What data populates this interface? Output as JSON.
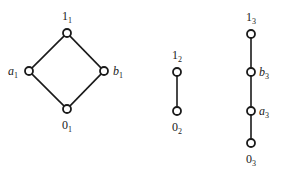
{
  "diagram": {
    "lattices": [
      {
        "id": "L1",
        "shape": "diamond",
        "nodes": [
          {
            "id": "1_1",
            "base": "1",
            "sub": "1",
            "italic": false,
            "x": 67,
            "y": 33,
            "lx": 67,
            "ly": 20,
            "anchor": "middle"
          },
          {
            "id": "a_1",
            "base": "a",
            "sub": "1",
            "italic": true,
            "x": 29,
            "y": 71,
            "lx": 18,
            "ly": 75,
            "anchor": "end"
          },
          {
            "id": "b_1",
            "base": "b",
            "sub": "1",
            "italic": true,
            "x": 104,
            "y": 71,
            "lx": 113,
            "ly": 75,
            "anchor": "start"
          },
          {
            "id": "0_1",
            "base": "0",
            "sub": "1",
            "italic": false,
            "x": 67,
            "y": 109,
            "lx": 67,
            "ly": 129,
            "anchor": "middle"
          }
        ],
        "edges": [
          [
            "0_1",
            "a_1"
          ],
          [
            "0_1",
            "b_1"
          ],
          [
            "a_1",
            "1_1"
          ],
          [
            "b_1",
            "1_1"
          ]
        ]
      },
      {
        "id": "L2",
        "shape": "chain",
        "nodes": [
          {
            "id": "1_2",
            "base": "1",
            "sub": "2",
            "italic": false,
            "x": 177,
            "y": 72,
            "lx": 177,
            "ly": 59,
            "anchor": "middle"
          },
          {
            "id": "0_2",
            "base": "0",
            "sub": "2",
            "italic": false,
            "x": 177,
            "y": 111,
            "lx": 177,
            "ly": 131,
            "anchor": "middle"
          }
        ],
        "edges": [
          [
            "0_2",
            "1_2"
          ]
        ]
      },
      {
        "id": "L3",
        "shape": "chain",
        "nodes": [
          {
            "id": "1_3",
            "base": "1",
            "sub": "3",
            "italic": false,
            "x": 251,
            "y": 34,
            "lx": 251,
            "ly": 21,
            "anchor": "middle"
          },
          {
            "id": "b_3",
            "base": "b",
            "sub": "3",
            "italic": true,
            "x": 251,
            "y": 72,
            "lx": 259,
            "ly": 76,
            "anchor": "start"
          },
          {
            "id": "a_3",
            "base": "a",
            "sub": "3",
            "italic": true,
            "x": 251,
            "y": 111,
            "lx": 259,
            "ly": 115,
            "anchor": "start"
          },
          {
            "id": "0_3",
            "base": "0",
            "sub": "3",
            "italic": false,
            "x": 251,
            "y": 143,
            "lx": 251,
            "ly": 163,
            "anchor": "middle"
          }
        ],
        "edges": [
          [
            "0_3",
            "a_3"
          ],
          [
            "a_3",
            "b_3"
          ],
          [
            "b_3",
            "1_3"
          ]
        ]
      }
    ]
  }
}
